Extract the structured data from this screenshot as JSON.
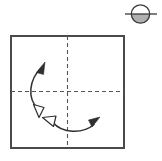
{
  "figure": {
    "background_color": "#ffffff",
    "ink_color": "#3a3a3a",
    "edge_color": "#4a4a4a",
    "crease_color": "#555555",
    "icon_fill_color": "#b0b0b0"
  },
  "paper": {
    "name": "square sheet",
    "shape": "square",
    "x": 11,
    "y": 36,
    "width": 113,
    "height": 112,
    "stroke_width": 1.2,
    "fill": "#ffffff",
    "stroke": "#4a4a4a"
  },
  "creases": [
    {
      "name": "vertical-center-crease",
      "orientation": "vertical",
      "style": "dashed",
      "x1": 67.5,
      "y1": 36,
      "x2": 67.5,
      "y2": 148,
      "dash": "4 3",
      "stroke": "#555555",
      "stroke_width": 1.1
    },
    {
      "name": "horizontal-center-crease",
      "orientation": "horizontal",
      "style": "dashed",
      "x1": 11,
      "y1": 91.5,
      "x2": 124,
      "y2": 91.5,
      "dash": "4 3",
      "stroke": "#555555",
      "stroke_width": 1.1
    }
  ],
  "arrows": [
    {
      "name": "left-vertical-fold-arrow",
      "description": "curved double-headed arrow spanning the horizontal crease on the left half",
      "path": "M 38 110 C 26 98, 28 80, 40 67",
      "stroke": "#2f2f2f",
      "stroke_width": 1.4,
      "head_start": {
        "style": "hollow",
        "name": "hollow-arrowhead-down",
        "points": "40,115 33,104 45,104",
        "rotation": 20
      },
      "head_end": {
        "style": "solid",
        "name": "solid-arrowhead-up",
        "points": "42,62 36,74 48,73",
        "rotation": -20
      }
    },
    {
      "name": "bottom-horizontal-fold-arrow",
      "description": "curved double-headed arrow crossing the vertical crease in the lower half",
      "path": "M 53 122 C 62 134, 82 134, 93 124",
      "stroke": "#2f2f2f",
      "stroke_width": 1.4,
      "head_start": {
        "style": "hollow",
        "name": "hollow-arrowhead-left",
        "points": "47,118 58,114 56,126",
        "rotation": 0
      },
      "head_end": {
        "style": "solid",
        "name": "solid-arrowhead-right",
        "points": "99,118 88,121 90,129",
        "rotation": 0
      }
    }
  ],
  "symbol": {
    "name": "fold-and-unfold-symbol",
    "description": "circle bisected by a horizontal line, lower half shaded",
    "circle": {
      "cx": 140.5,
      "cy": 14,
      "r": 9.2,
      "stroke": "#3a3a3a",
      "stroke_width": 1.3,
      "fill": "#ffffff"
    },
    "shaded_half": {
      "fill": "#b0b0b0",
      "half": "lower"
    },
    "line": {
      "x1": 125,
      "y1": 14,
      "x2": 157,
      "y2": 14,
      "stroke": "#3a3a3a",
      "stroke_width": 1.3
    }
  }
}
